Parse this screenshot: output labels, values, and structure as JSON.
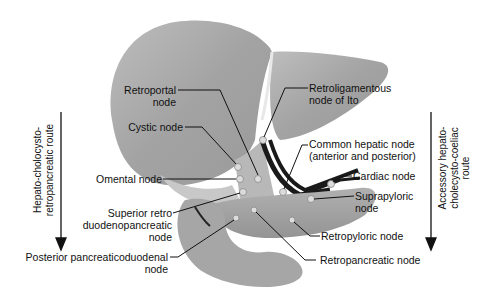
{
  "diagram": {
    "type": "anatomical-illustration",
    "organs": [
      "liver",
      "gallbladder",
      "duodenum",
      "pancreas",
      "stomach"
    ],
    "routes": {
      "left": {
        "label_line1": "Hepato-cholocysto-",
        "label_line2": "retropancreatic route",
        "direction": "down"
      },
      "right": {
        "label_line1": "Accessory hepato-",
        "label_line2": "cholecysto-coeliac",
        "label_line3": "route",
        "direction": "down"
      }
    },
    "labels": {
      "retroportal": {
        "line1": "Retroportal",
        "line2": "node"
      },
      "cystic": {
        "line1": "Cystic node"
      },
      "omental": {
        "line1": "Omental node"
      },
      "superior_retro": {
        "line1": "Superior retro",
        "line2": "duodenopancreatic",
        "line3": "node"
      },
      "posterior_pancreatico": {
        "line1": "Posterior pancreaticoduodenal",
        "line2": "node"
      },
      "retroligamentous": {
        "line1": "Retroligamentous",
        "line2": "node of Ito"
      },
      "common_hepatic": {
        "line1": "Common hepatic node",
        "line2": "(anterior and posterior)"
      },
      "cardiac": {
        "line1": "Cardiac node"
      },
      "suprapyloric": {
        "line1": "Suprapyloric",
        "line2": "node"
      },
      "retropyloric": {
        "line1": "Retropyloric node"
      },
      "retropancreatic": {
        "line1": "Retropancreatic node"
      }
    },
    "colors": {
      "organ_fill": "#a8a8a8",
      "organ_light": "#c4c4c4",
      "vessel": "#1a1a1a",
      "node": "#d8d8d8",
      "text": "#111111"
    }
  }
}
